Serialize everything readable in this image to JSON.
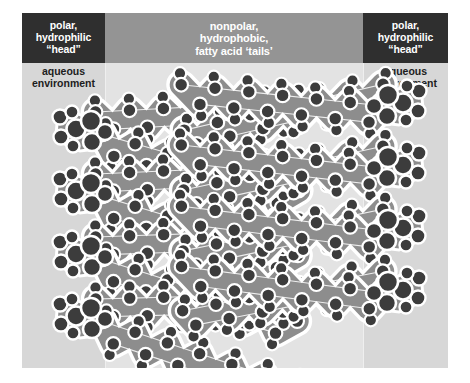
{
  "figure": {
    "title_left_header": "polar,\nhydrophilic\n“head”",
    "title_center_header": "nonpolar,\nhydrophobic,\nfatty acid ‘tails’",
    "title_right_header": "polar,\nhydrophilic\n“head”",
    "left_environment_label": "aqueous\nenvironment",
    "right_environment_label": "aqueous\nenvironment"
  },
  "colors": {
    "header_box_background": "#2f2f2f",
    "header_band_background": "#949494",
    "header_text": "#ffffff",
    "aqueous_column_background": "#d7d7d7",
    "hydrophobic_column_background": "#e3e3e3",
    "environment_label_text": "#1d1d1d",
    "atom_dark": "#3c3c3c",
    "bond_gray": "#8d8d8d",
    "outline_white": "#ffffff",
    "page_background": "#ffffff"
  },
  "regions": [
    {
      "name": "left-aqueous",
      "label": "aqueous environment",
      "header": "polar, hydrophilic “head”"
    },
    {
      "name": "center-hydrophobic",
      "label": "",
      "header": "nonpolar, hydrophobic, fatty acid ‘tails’"
    },
    {
      "name": "right-aqueous",
      "label": "aqueous environment",
      "header": "polar, hydrophilic “head”"
    }
  ],
  "bilayer": {
    "description": "Space-filling phospholipid bilayer cross-section",
    "row_count": 4,
    "leaflets": 2,
    "left_leaflet_heads_x": 52,
    "right_leaflet_heads_x": 383,
    "row_y_positions": [
      118,
      180,
      243,
      305
    ],
    "molecules_per_leaflet_per_row": 1,
    "tail_chain_length": 13
  }
}
